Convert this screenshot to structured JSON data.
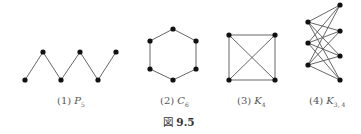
{
  "figure": {
    "label_prefix": "図",
    "number": "9.5"
  },
  "graphs": [
    {
      "id": "P5",
      "caption_index": "(1)",
      "caption_symbol": "P",
      "caption_subscript": "5",
      "nodes": [
        [
          25,
          80
        ],
        [
          43,
          52
        ],
        [
          61,
          80
        ],
        [
          80,
          52
        ],
        [
          98,
          80
        ],
        [
          116,
          52
        ]
      ],
      "edges": [
        [
          0,
          1
        ],
        [
          1,
          2
        ],
        [
          2,
          3
        ],
        [
          3,
          4
        ],
        [
          4,
          5
        ]
      ]
    },
    {
      "id": "C6",
      "caption_index": "(2)",
      "caption_symbol": "C",
      "caption_subscript": "6",
      "nodes": [
        [
          173,
          29
        ],
        [
          196,
          41
        ],
        [
          196,
          69
        ],
        [
          173,
          80
        ],
        [
          150,
          69
        ],
        [
          150,
          41
        ]
      ],
      "edges": [
        [
          0,
          1
        ],
        [
          1,
          2
        ],
        [
          2,
          3
        ],
        [
          3,
          4
        ],
        [
          4,
          5
        ],
        [
          5,
          0
        ]
      ]
    },
    {
      "id": "K4",
      "caption_index": "(3)",
      "caption_symbol": "K",
      "caption_subscript": "4",
      "nodes": [
        [
          229,
          35
        ],
        [
          275,
          35
        ],
        [
          275,
          80
        ],
        [
          229,
          80
        ]
      ],
      "edges": [
        [
          0,
          1
        ],
        [
          1,
          2
        ],
        [
          2,
          3
        ],
        [
          3,
          0
        ],
        [
          0,
          2
        ],
        [
          1,
          3
        ]
      ]
    },
    {
      "id": "K34",
      "caption_index": "(4)",
      "caption_symbol": "K",
      "caption_subscript": "3, 4",
      "nodes": [
        [
          308,
          22
        ],
        [
          308,
          43
        ],
        [
          308,
          65
        ],
        [
          340,
          5
        ],
        [
          340,
          31
        ],
        [
          340,
          56
        ],
        [
          340,
          80
        ]
      ],
      "edges": [
        [
          0,
          3
        ],
        [
          0,
          4
        ],
        [
          0,
          5
        ],
        [
          0,
          6
        ],
        [
          1,
          3
        ],
        [
          1,
          4
        ],
        [
          1,
          5
        ],
        [
          1,
          6
        ],
        [
          2,
          3
        ],
        [
          2,
          4
        ],
        [
          2,
          5
        ],
        [
          2,
          6
        ]
      ]
    }
  ],
  "captions": [
    {
      "index": "(1)",
      "symbol": "P",
      "sub": "5",
      "x": 57,
      "y": 95
    },
    {
      "index": "(2)",
      "symbol": "C",
      "sub": "6",
      "x": 160,
      "y": 95
    },
    {
      "index": "(3)",
      "symbol": "K",
      "sub": "4",
      "x": 237,
      "y": 95
    },
    {
      "index": "(4)",
      "symbol": "K",
      "sub": "3, 4",
      "x": 309,
      "y": 95
    }
  ]
}
